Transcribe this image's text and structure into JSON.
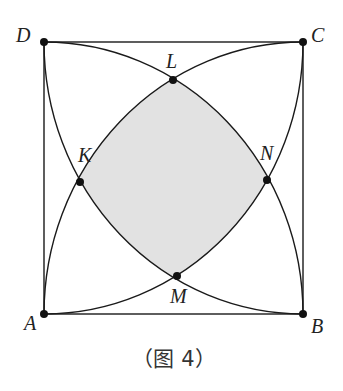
{
  "figure": {
    "caption": "（图 4）",
    "colors": {
      "stroke": "#1a1a1a",
      "fill_shaded": "#e3e3e3",
      "background": "#ffffff"
    },
    "points": [
      {
        "name": "A",
        "label": "A"
      },
      {
        "name": "B",
        "label": "B"
      },
      {
        "name": "C",
        "label": "C"
      },
      {
        "name": "D",
        "label": "D"
      },
      {
        "name": "K",
        "label": "K"
      },
      {
        "name": "L",
        "label": "L"
      },
      {
        "name": "M",
        "label": "M"
      },
      {
        "name": "N",
        "label": "N"
      }
    ]
  }
}
